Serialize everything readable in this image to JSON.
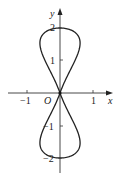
{
  "chart_data": {
    "type": "line",
    "title": "",
    "xlabel": "x",
    "ylabel": "y",
    "origin_label": "O",
    "xticks": [
      {
        "value": -1,
        "label": "−1"
      },
      {
        "value": 1,
        "label": "1"
      }
    ],
    "yticks": [
      {
        "value": 2,
        "label": "2"
      },
      {
        "value": 1,
        "label": "1"
      },
      {
        "value": -1,
        "label": "−1"
      },
      {
        "value": -2,
        "label": "−2"
      }
    ],
    "xlim": [
      -1.6,
      1.6
    ],
    "ylim": [
      -2.4,
      2.1
    ],
    "grid": false,
    "series": [
      {
        "name": "figure-eight curve",
        "description": "closed figure-eight (lemniscate-like) curve crossing at origin, top at (0,2), bottom at (0,-2), max |x| ≈ 0.7",
        "x": [
          0,
          0.35,
          0.61,
          0.7,
          0.61,
          0.35,
          0,
          -0.35,
          -0.61,
          -0.7,
          -0.61,
          -0.35,
          0,
          0.35,
          0.61,
          0.7,
          0.61,
          0.35,
          0,
          -0.35,
          -0.61,
          -0.7,
          -0.61,
          -0.35,
          0
        ],
        "y": [
          0,
          0.52,
          1.0,
          1.41,
          1.73,
          1.93,
          2,
          1.93,
          1.73,
          1.41,
          1.0,
          0.52,
          0,
          -0.52,
          -1.0,
          -1.41,
          -1.73,
          -1.93,
          -2,
          -1.93,
          -1.73,
          -1.41,
          -1.0,
          -0.52,
          0
        ]
      }
    ]
  },
  "labels": {
    "x_axis": "x",
    "y_axis": "y",
    "origin": "O",
    "x_neg1": "−1",
    "x_pos1": "1",
    "y_pos2": "2",
    "y_pos1": "1",
    "y_neg1": "−1",
    "y_neg2": "−2"
  }
}
